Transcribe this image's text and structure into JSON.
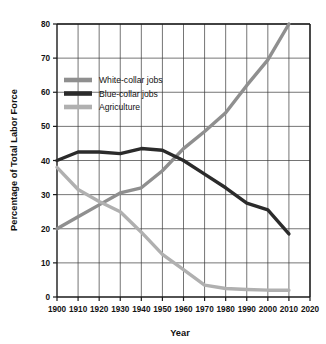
{
  "chart_data": {
    "type": "line",
    "title": "",
    "xlabel": "Year",
    "ylabel": "Percentage of Total Labor Force",
    "xlim": [
      1900,
      2020
    ],
    "ylim": [
      0,
      80
    ],
    "grid": true,
    "legend_position": "upper-left-inside",
    "x": [
      1900,
      1910,
      1920,
      1930,
      1940,
      1950,
      1960,
      1970,
      1980,
      1990,
      2000,
      2010
    ],
    "xticks": [
      "1900",
      "1910",
      "1920",
      "1930",
      "1940",
      "1950",
      "1960",
      "1970",
      "1980",
      "1990",
      "2000",
      "2010",
      "2020"
    ],
    "yticks": [
      "0",
      "10",
      "20",
      "30",
      "40",
      "50",
      "60",
      "70",
      "80"
    ],
    "series": [
      {
        "name": "White-collar jobs",
        "color": "#8f8f8f",
        "values": [
          20.0,
          23.5,
          27.0,
          30.5,
          32.0,
          37.0,
          43.5,
          48.5,
          54.0,
          62.0,
          69.5,
          80.0
        ]
      },
      {
        "name": "Blue-collar jobs",
        "color": "#2b2b2b",
        "values": [
          40.0,
          42.5,
          42.5,
          42.0,
          43.5,
          43.0,
          40.0,
          36.0,
          32.0,
          27.5,
          25.5,
          18.5
        ]
      },
      {
        "name": "Agriculture",
        "color": "#b0b0b0",
        "values": [
          38.0,
          31.5,
          28.0,
          25.0,
          19.0,
          12.5,
          8.0,
          3.5,
          2.5,
          2.2,
          2.0,
          2.0
        ]
      }
    ]
  },
  "legend": {
    "items": [
      {
        "label": "White-collar jobs"
      },
      {
        "label": "Blue-collar jobs"
      },
      {
        "label": "Agriculture"
      }
    ]
  }
}
